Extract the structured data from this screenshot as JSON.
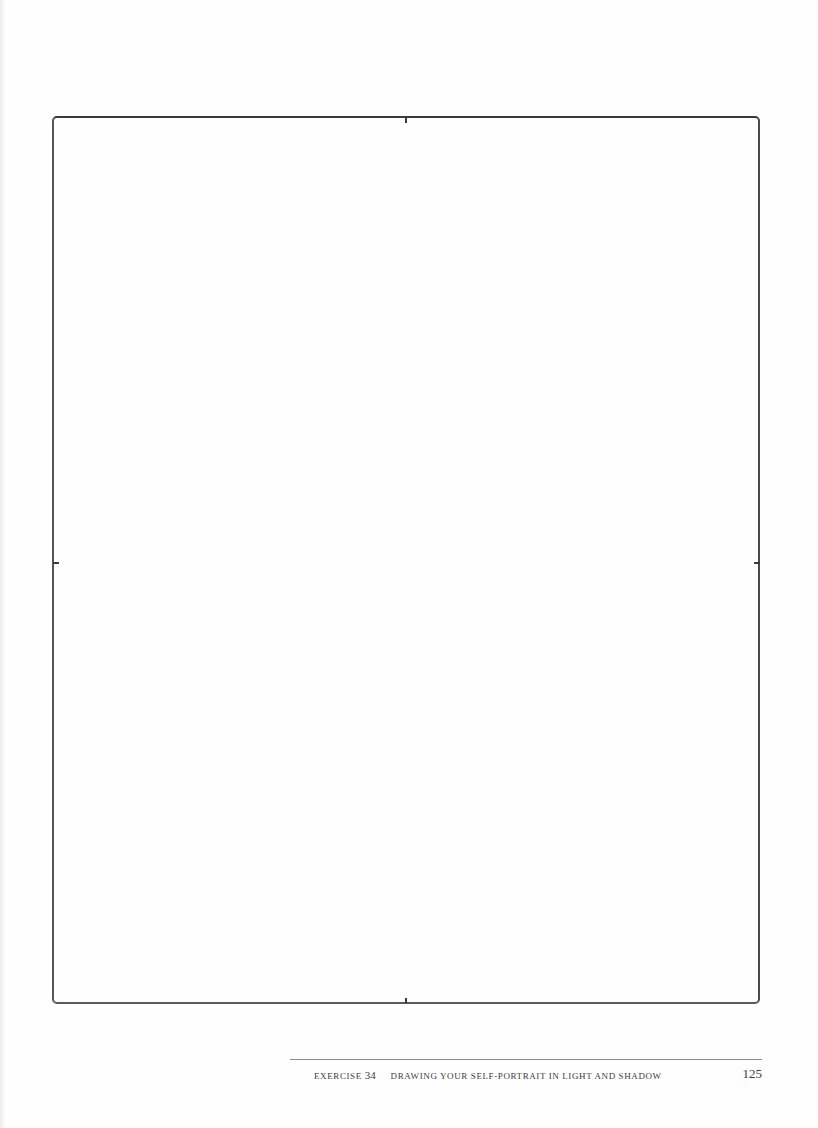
{
  "page": {
    "frame": {
      "description": "empty drawing frame with center registration ticks"
    },
    "footer": {
      "exercise_label": "EXERCISE",
      "exercise_number": "34",
      "title": "DRAWING YOUR SELF-PORTRAIT IN LIGHT AND SHADOW",
      "page_number": "125"
    },
    "colors": {
      "frame_stroke": "#4a4a4a",
      "text": "#3c3c3c",
      "rule": "#8a8a8a"
    }
  }
}
